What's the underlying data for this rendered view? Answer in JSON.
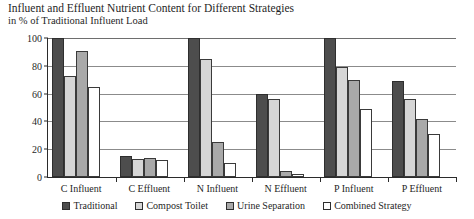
{
  "chart_data": {
    "type": "bar",
    "title": "Influent and Effluent Nutrient Content for Different Strategies",
    "subtitle": "in % of Traditional Influent Load",
    "xlabel": "",
    "ylabel": "",
    "ylim": [
      0,
      100
    ],
    "ytick_values": [
      0,
      20,
      40,
      60,
      80,
      100
    ],
    "ytick_labels": [
      "0",
      "20",
      "40",
      "60",
      "80",
      "100"
    ],
    "grid": true,
    "legend_position": "bottom",
    "categories": [
      "C Influent",
      "C Effluent",
      "N Influent",
      "N Effluent",
      "P Influent",
      "P Effluent"
    ],
    "series": [
      {
        "name": "Traditional",
        "color": "#4d4d4d",
        "values": [
          100,
          15,
          100,
          60,
          100,
          69
        ]
      },
      {
        "name": "Compost Toilet",
        "color": "#d6d6d6",
        "values": [
          73,
          13,
          85,
          56,
          79,
          56
        ]
      },
      {
        "name": "Urine Separation",
        "color": "#a9a9a9",
        "values": [
          91,
          14,
          25,
          4,
          70,
          42
        ]
      },
      {
        "name": "Combined Strategy",
        "color": "#ffffff",
        "values": [
          65,
          12,
          10,
          2,
          49,
          31
        ]
      }
    ]
  }
}
